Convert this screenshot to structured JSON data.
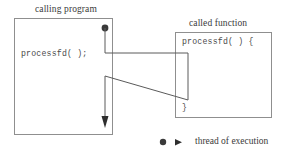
{
  "diagram": {
    "type": "control-flow-call-return",
    "caller": {
      "title": "calling program",
      "code_line": "processfd( );"
    },
    "callee": {
      "title": "called function",
      "code_open": "processfd( ) {",
      "code_close": "}"
    },
    "legend": {
      "text": "thread of execution",
      "dot_symbol": "start-dot",
      "arrow_symbol": "arrowhead-right"
    },
    "colors": {
      "stroke": "#8f8f8f",
      "thread": "#5a5a5a",
      "text": "#3a3a3a",
      "code": "#4a4a4a",
      "background": "#ffffff"
    }
  }
}
